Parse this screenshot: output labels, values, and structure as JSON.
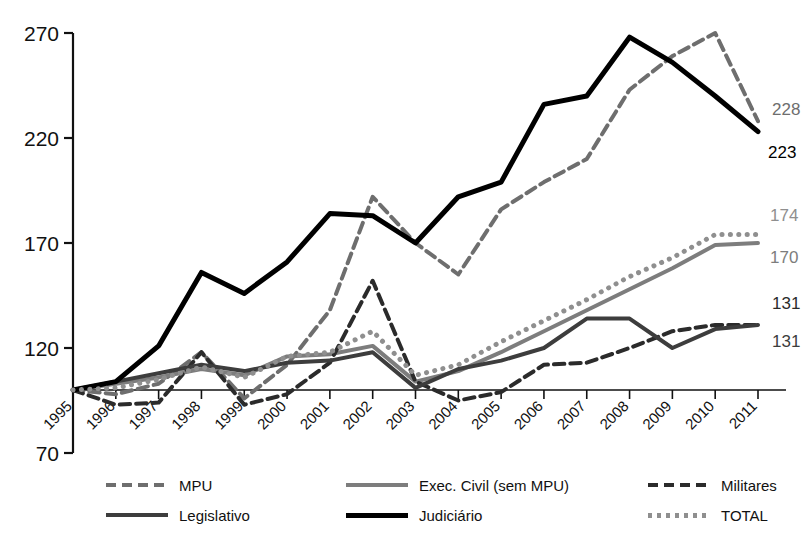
{
  "chart_data": {
    "type": "line",
    "title": "",
    "xlabel": "",
    "ylabel": "",
    "x": [
      "1995",
      "1996",
      "1997",
      "1998",
      "1999",
      "2000",
      "2001",
      "2002",
      "2003",
      "2004",
      "2005",
      "2006",
      "2007",
      "2008",
      "2009",
      "2010",
      "2011"
    ],
    "ylim": [
      70,
      270
    ],
    "yticks": [
      70,
      120,
      170,
      220,
      270
    ],
    "grid": false,
    "legend_position": "bottom",
    "series": [
      {
        "name": "MPU",
        "color": "#6e6e6e",
        "style": "dashed",
        "width": 4,
        "end_label": "228",
        "values": [
          100,
          98,
          103,
          118,
          96,
          112,
          138,
          192,
          170,
          155,
          186,
          199,
          210,
          243,
          259,
          270,
          228
        ]
      },
      {
        "name": "Exec. Civil (sem MPU)",
        "color": "#7d7d7d",
        "style": "solid",
        "width": 4,
        "end_label": "170",
        "values": [
          100,
          103,
          106,
          110,
          107,
          116,
          117,
          121,
          104,
          109,
          118,
          128,
          138,
          148,
          158,
          169,
          170
        ]
      },
      {
        "name": "Militares",
        "color": "#2b2b2b",
        "style": "dashed",
        "width": 4,
        "end_label": "131",
        "values": [
          100,
          93,
          94,
          118,
          93,
          98,
          113,
          152,
          104,
          95,
          99,
          112,
          113,
          120,
          128,
          131,
          131
        ]
      },
      {
        "name": "Legislativo",
        "color": "#3d3d3d",
        "style": "solid",
        "width": 4,
        "end_label": "131",
        "values": [
          100,
          104,
          108,
          112,
          109,
          113,
          114,
          118,
          101,
          110,
          114,
          120,
          134,
          134,
          120,
          129,
          131
        ]
      },
      {
        "name": "Judiciário",
        "color": "#000000",
        "style": "solid",
        "width": 5,
        "end_label": "223",
        "values": [
          100,
          104,
          121,
          156,
          146,
          161,
          184,
          183,
          170,
          192,
          199,
          236,
          240,
          268,
          256,
          240,
          223
        ]
      },
      {
        "name": "TOTAL",
        "color": "#8f8f8f",
        "style": "dotted",
        "width": 5,
        "end_label": "174",
        "values": [
          100,
          101,
          105,
          111,
          106,
          116,
          118,
          128,
          107,
          112,
          123,
          133,
          143,
          154,
          163,
          174,
          174
        ]
      }
    ]
  },
  "legend": {
    "rows": [
      [
        {
          "label": "MPU",
          "series": 0
        },
        {
          "label": "Exec. Civil (sem MPU)",
          "series": 1
        },
        {
          "label": "Militares",
          "series": 2
        }
      ],
      [
        {
          "label": "Legislativo",
          "series": 3
        },
        {
          "label": "Judiciário",
          "series": 4
        },
        {
          "label": "TOTAL",
          "series": 5
        }
      ]
    ]
  }
}
